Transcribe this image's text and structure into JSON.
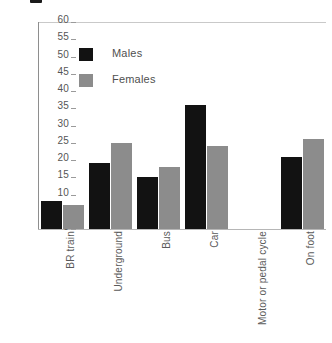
{
  "chart_data": {
    "type": "bar",
    "title": "",
    "xlabel": "",
    "ylabel": "",
    "ylim": [
      0,
      60
    ],
    "ytick_step": 5,
    "yticks": [
      0,
      5,
      10,
      15,
      20,
      25,
      30,
      35,
      40,
      45,
      50,
      55,
      60
    ],
    "categories": [
      "BR train",
      "Underground",
      "Bus",
      "Car",
      "Motor or pedal cycle",
      "On foot"
    ],
    "series": [
      {
        "name": "Males",
        "color": "#121212",
        "values": [
          8,
          19,
          15,
          36,
          0,
          21
        ]
      },
      {
        "name": "Females",
        "color": "#8c8c8c",
        "values": [
          7,
          25,
          18,
          24,
          0,
          26
        ]
      }
    ],
    "grid": false,
    "legend_position": "inside-top-left",
    "legend_entries": [
      "Males",
      "Females"
    ]
  },
  "legend": {
    "items": [
      {
        "label": "Males",
        "swatch": "males"
      },
      {
        "label": "Females",
        "swatch": "females"
      }
    ]
  },
  "colors": {
    "males": "#121212",
    "females": "#8c8c8c",
    "axis": "#8e8e8e",
    "text": "#4f4f4f",
    "background": "#ffffff"
  }
}
